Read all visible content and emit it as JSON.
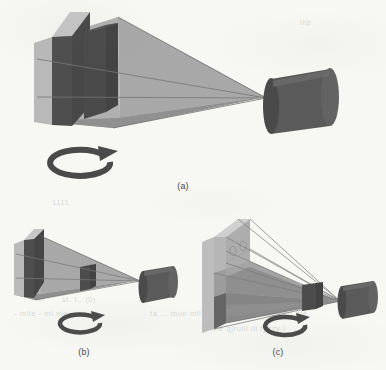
{
  "figure": {
    "background_color": "#f7f7f4",
    "ink_color": "#4a4a4a",
    "panels": [
      {
        "id": "a",
        "label": "(a)",
        "caption_position": "bottom-center",
        "description": "Wide view frustum from camera toward two dark occluding slabs; rotation arrow below",
        "elements": {
          "camera": "dark-gray-cylinder",
          "frustum": "light-gray-cone",
          "occluders": 2,
          "rotation_arrow": "clockwise-circular-arrow",
          "ray_lines": 3
        }
      },
      {
        "id": "b",
        "label": "(b)",
        "caption_position": "bottom-center",
        "description": "Narrow view frustum with single small occluder box near camera; rotation arrow below",
        "elements": {
          "camera": "dark-gray-cylinder",
          "frustum": "light-gray-cone",
          "occluders": 2,
          "rotation_arrow": "clockwise-circular-arrow",
          "ray_lines": 2
        }
      },
      {
        "id": "c",
        "label": "(c)",
        "caption_position": "bottom-center",
        "description": "Tall flat projection wall with many converging rays through a small occluder to the camera; rotation arrow below",
        "elements": {
          "camera": "dark-gray-cylinder",
          "frustum": "light-gray-cone",
          "projection_wall": "tall-light-gray-plane",
          "occluders": 1,
          "rotation_arrow": "clockwise-circular-arrow",
          "ray_lines": 7
        }
      }
    ],
    "palette": {
      "paper": "#f7f7f4",
      "cone_light": "#a6a6a6",
      "cone_mid": "#999999",
      "cone_shadow": "#8a8a8a",
      "face_light": "#bdbdbd",
      "face_top": "#cccccc",
      "face_dark": "#4e4e4e",
      "face_darker": "#444444",
      "cylinder_body": "#595959",
      "cylinder_cap": "#4a4a4a",
      "cylinder_hilite": "#6b6b6b",
      "arrow": "#4a4a4a",
      "ray_line": "#7a7a7a",
      "edge_line": "#6e6e6e"
    },
    "ghost_marks": [
      {
        "text": "of",
        "x": 38,
        "y": 298
      },
      {
        "text": "st. I., (0)",
        "x": 60,
        "y": 299
      },
      {
        "text": "ca. n. ritw. muig riqui",
        "x": 204,
        "y": 299
      },
      {
        "text": "- mile - mi nie",
        "x": 14,
        "y": 313
      },
      {
        "text": "ta ... mun mil",
        "x": 150,
        "y": 313
      },
      {
        "text": "(m) zr tupping itte",
        "x": 238,
        "y": 313
      },
      {
        "text": "ine  qjruill ili tyzzy-i",
        "x": 212,
        "y": 327
      },
      {
        "text": "iliz",
        "x": 300,
        "y": 22
      },
      {
        "text": "1111",
        "x": 52,
        "y": 200
      }
    ]
  }
}
